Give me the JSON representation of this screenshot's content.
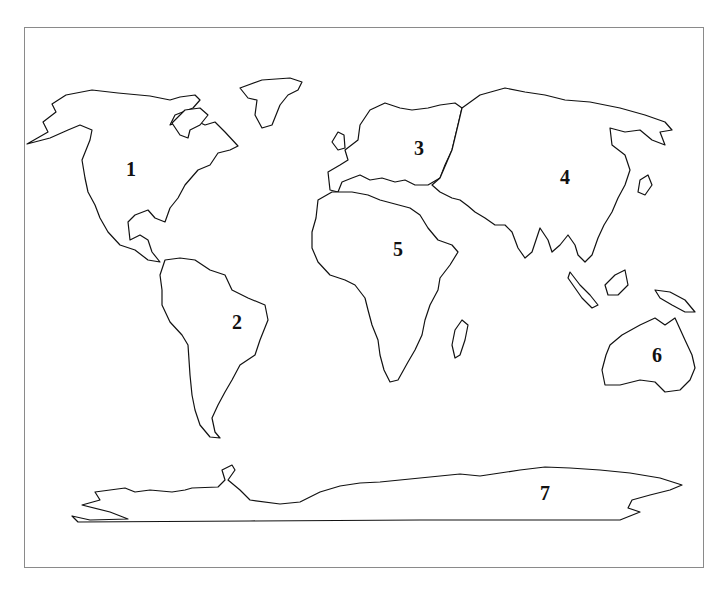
{
  "labels": [
    {
      "number": "1",
      "region": "North America"
    },
    {
      "number": "2",
      "region": "South America"
    },
    {
      "number": "3",
      "region": "Europe"
    },
    {
      "number": "4",
      "region": "Asia"
    },
    {
      "number": "5",
      "region": "Africa"
    },
    {
      "number": "6",
      "region": "Australia"
    },
    {
      "number": "7",
      "region": "Antarctica"
    }
  ]
}
